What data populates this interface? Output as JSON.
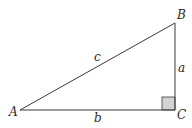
{
  "diagram": {
    "type": "right-triangle",
    "vertices": {
      "A": {
        "label": "A",
        "x": 20,
        "y": 110
      },
      "B": {
        "label": "B",
        "x": 175,
        "y": 23
      },
      "C": {
        "label": "C",
        "x": 175,
        "y": 110
      }
    },
    "sides": {
      "a": {
        "label": "a",
        "between": [
          "B",
          "C"
        ]
      },
      "b": {
        "label": "b",
        "between": [
          "A",
          "C"
        ]
      },
      "c": {
        "label": "c",
        "between": [
          "A",
          "B"
        ]
      }
    },
    "right_angle_at": "C",
    "colors": {
      "line": "#3a3a3a",
      "right_angle_fill": "#d3d3d3",
      "text": "#2a2a2a"
    }
  }
}
